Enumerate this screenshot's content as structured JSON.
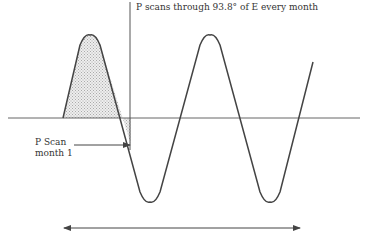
{
  "labels": {
    "top": "P scans through 93.8° of E every month",
    "scan_line1": "P Scan",
    "scan_line2": "month 1"
  },
  "colors": {
    "stroke": "#444444",
    "baseline": "#666666",
    "hatch": "#bbbbbb"
  }
}
